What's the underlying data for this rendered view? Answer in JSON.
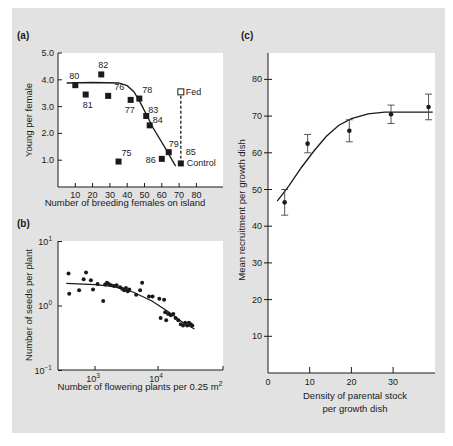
{
  "colors": {
    "panel_bg": "#e2e2e2",
    "plot_bg": "#ffffff",
    "ink": "#1a1a1a"
  },
  "chart_data": [
    {
      "panel": "(a)",
      "type": "scatter",
      "title": "",
      "xlabel": "Number of breeding females on island",
      "ylabel": "Young per female",
      "xlim": [
        0,
        90
      ],
      "ylim": [
        0,
        5.0
      ],
      "x_ticks": [
        "10",
        "20",
        "30",
        "40",
        "50",
        "60",
        "70",
        "80"
      ],
      "y_ticks": [
        "1.0",
        "2.0",
        "3.0",
        "4.0",
        "5.0"
      ],
      "points": [
        {
          "label": "80",
          "x": 10,
          "y": 3.8
        },
        {
          "label": "81",
          "x": 16,
          "y": 3.45
        },
        {
          "label": "82",
          "x": 25,
          "y": 4.2
        },
        {
          "label": "76",
          "x": 29,
          "y": 3.4
        },
        {
          "label": "75",
          "x": 35,
          "y": 0.95
        },
        {
          "label": "77",
          "x": 42,
          "y": 3.25
        },
        {
          "label": "78",
          "x": 47,
          "y": 3.3
        },
        {
          "label": "83",
          "x": 51,
          "y": 2.65
        },
        {
          "label": "84",
          "x": 53,
          "y": 2.3
        },
        {
          "label": "86",
          "x": 60,
          "y": 1.05
        },
        {
          "label": "79",
          "x": 64,
          "y": 1.3
        },
        {
          "label": "85",
          "x": 71,
          "y": 0.88,
          "note": "Control"
        }
      ],
      "fed_point": {
        "label": "Fed",
        "x": 71,
        "y": 3.55
      },
      "annotations": [
        "Fed",
        "Control",
        "85"
      ],
      "fit_curve": [
        [
          5,
          3.88
        ],
        [
          20,
          3.9
        ],
        [
          35,
          3.88
        ],
        [
          40,
          3.78
        ],
        [
          44,
          3.55
        ],
        [
          48,
          3.1
        ],
        [
          55,
          2.2
        ],
        [
          62,
          1.45
        ],
        [
          68,
          0.78
        ]
      ]
    },
    {
      "panel": "(b)",
      "type": "scatter",
      "title": "",
      "xlabel": "Number of flowering plants per 0.25 m2",
      "ylabel": "Number of seeds per plant",
      "xscale": "log",
      "yscale": "log",
      "xlim": [
        260,
        100000
      ],
      "ylim": [
        0.1,
        10
      ],
      "x_ticks": [
        "10^3",
        "10^4"
      ],
      "y_ticks": [
        "10^-1",
        "10^0",
        "10^1"
      ],
      "points": [
        {
          "x": 380,
          "y": 3.2
        },
        {
          "x": 390,
          "y": 1.55
        },
        {
          "x": 560,
          "y": 1.75
        },
        {
          "x": 660,
          "y": 2.6
        },
        {
          "x": 720,
          "y": 3.3
        },
        {
          "x": 860,
          "y": 2.5
        },
        {
          "x": 930,
          "y": 1.8
        },
        {
          "x": 1100,
          "y": 2.2
        },
        {
          "x": 1350,
          "y": 1.2
        },
        {
          "x": 1450,
          "y": 2.15
        },
        {
          "x": 1550,
          "y": 2.3
        },
        {
          "x": 1650,
          "y": 2.2
        },
        {
          "x": 1800,
          "y": 2.1
        },
        {
          "x": 2000,
          "y": 2.05
        },
        {
          "x": 2200,
          "y": 2.1
        },
        {
          "x": 2500,
          "y": 1.95
        },
        {
          "x": 2700,
          "y": 1.85
        },
        {
          "x": 2900,
          "y": 1.75
        },
        {
          "x": 3100,
          "y": 1.9
        },
        {
          "x": 3300,
          "y": 1.7
        },
        {
          "x": 3500,
          "y": 1.8
        },
        {
          "x": 4500,
          "y": 1.5
        },
        {
          "x": 5200,
          "y": 1.75
        },
        {
          "x": 5600,
          "y": 2.3
        },
        {
          "x": 7200,
          "y": 1.4
        },
        {
          "x": 8200,
          "y": 1.4
        },
        {
          "x": 10500,
          "y": 1.3
        },
        {
          "x": 11000,
          "y": 0.65
        },
        {
          "x": 12500,
          "y": 1.25
        },
        {
          "x": 13000,
          "y": 0.8
        },
        {
          "x": 13500,
          "y": 0.6
        },
        {
          "x": 14500,
          "y": 0.75
        },
        {
          "x": 16000,
          "y": 0.72
        },
        {
          "x": 17500,
          "y": 0.75
        },
        {
          "x": 19000,
          "y": 0.65
        },
        {
          "x": 21000,
          "y": 0.6
        },
        {
          "x": 23000,
          "y": 0.52
        },
        {
          "x": 25000,
          "y": 0.5
        },
        {
          "x": 27000,
          "y": 0.55
        },
        {
          "x": 29000,
          "y": 0.5
        },
        {
          "x": 31000,
          "y": 0.55
        },
        {
          "x": 33000,
          "y": 0.52
        },
        {
          "x": 35000,
          "y": 0.5
        }
      ],
      "fit_curve": [
        [
          350,
          2.25
        ],
        [
          1000,
          2.15
        ],
        [
          2000,
          2.0
        ],
        [
          4000,
          1.65
        ],
        [
          8000,
          1.2
        ],
        [
          15000,
          0.8
        ],
        [
          25000,
          0.55
        ],
        [
          38000,
          0.44
        ]
      ]
    },
    {
      "panel": "(c)",
      "type": "scatter",
      "title": "",
      "xlabel": "Density of parental stock per growth dish",
      "ylabel": "Mean recruitment per growth dish",
      "xlim": [
        0,
        40
      ],
      "ylim": [
        0,
        87
      ],
      "x_ticks": [
        "0",
        "10",
        "20",
        "30"
      ],
      "y_ticks": [
        "10",
        "20",
        "30",
        "40",
        "50",
        "60",
        "70",
        "80"
      ],
      "points": [
        {
          "x": 4,
          "y": 46.5,
          "err_low": 43,
          "err_high": 50
        },
        {
          "x": 9.5,
          "y": 62.5,
          "err_low": 60,
          "err_high": 65
        },
        {
          "x": 19.5,
          "y": 66,
          "err_low": 63,
          "err_high": 69
        },
        {
          "x": 29.5,
          "y": 70.5,
          "err_low": 68,
          "err_high": 73
        },
        {
          "x": 38.5,
          "y": 72.5,
          "err_low": 69,
          "err_high": 76
        }
      ],
      "fit_curve": [
        [
          2.2,
          46.8
        ],
        [
          5,
          51
        ],
        [
          8,
          56
        ],
        [
          11,
          60.5
        ],
        [
          14,
          64.5
        ],
        [
          17,
          67.5
        ],
        [
          20,
          69.3
        ],
        [
          24,
          70.6
        ],
        [
          28,
          71.1
        ],
        [
          35,
          71.1
        ],
        [
          39.5,
          71.1
        ]
      ]
    }
  ],
  "panels": {
    "a": {
      "label": "(a)",
      "xlabel": "Number of breeding females on island",
      "ylabel": "Young per female",
      "x_ticks": [
        "10",
        "20",
        "30",
        "40",
        "50",
        "60",
        "70",
        "80"
      ],
      "y_ticks": [
        "1.0",
        "2.0",
        "3.0",
        "4.0",
        "5.0"
      ],
      "fed_label": "Fed",
      "control_label": "Control",
      "control_year": "85"
    },
    "b": {
      "label": "(b)",
      "xlabel": "Number of flowering plants per 0.25 m",
      "xlabel_sup": "2",
      "ylabel": "Number of seeds per plant",
      "x_ticks": [
        {
          "base": "10",
          "exp": "3"
        },
        {
          "base": "10",
          "exp": "4"
        }
      ],
      "y_ticks": [
        {
          "base": "10",
          "exp": "1"
        },
        {
          "base": "10",
          "exp": "0"
        },
        {
          "base": "10",
          "exp": "−1"
        }
      ]
    },
    "c": {
      "label": "(c)",
      "xlabel_line1": "Density of parental stock",
      "xlabel_line2": "per growth dish",
      "ylabel": "Mean recruitment per growth dish",
      "x_ticks": [
        "0",
        "10",
        "20",
        "30"
      ],
      "y_ticks": [
        "10",
        "20",
        "30",
        "40",
        "50",
        "60",
        "70",
        "80"
      ]
    }
  }
}
